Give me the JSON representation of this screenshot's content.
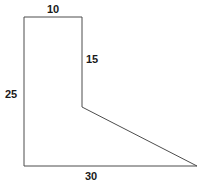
{
  "figure": {
    "kind": "geometry-dimension-diagram",
    "canvas": {
      "width": 202,
      "height": 187,
      "background": "#ffffff"
    },
    "stroke": {
      "color": "#4d4d4d",
      "width": 1
    },
    "shape": {
      "name": "flag-shaped-polygon",
      "points": "24,17 82,17 82,107 197,166 24,166",
      "vertices": [
        {
          "name": "top-left",
          "x": 24,
          "y": 17
        },
        {
          "name": "top-right",
          "x": 82,
          "y": 17
        },
        {
          "name": "inner-notch",
          "x": 82,
          "y": 107
        },
        {
          "name": "right-apex",
          "x": 197,
          "y": 166
        },
        {
          "name": "bottom-left",
          "x": 24,
          "y": 166
        }
      ]
    },
    "labels": {
      "top": "10",
      "right_inner": "15",
      "left": "25",
      "bottom": "30"
    }
  }
}
